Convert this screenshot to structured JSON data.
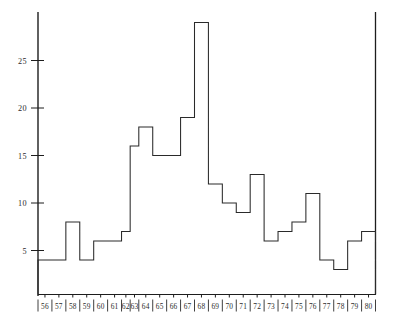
{
  "chart_data": {
    "type": "bar",
    "title": "",
    "subtitle": "",
    "xlabel": "",
    "ylabel": "",
    "categories": [
      "56",
      "57",
      "58",
      "59",
      "60",
      "61",
      "62",
      "63",
      "64",
      "65",
      "66",
      "67",
      "68",
      "69",
      "70",
      "71",
      "72",
      "73",
      "74",
      "75",
      "76",
      "77",
      "78",
      "79",
      "80"
    ],
    "values": [
      4,
      4,
      8,
      4,
      6,
      6,
      7,
      16,
      18,
      15,
      15,
      19,
      29,
      12,
      10,
      9,
      13,
      6,
      7,
      8,
      11,
      4,
      3,
      6,
      7
    ],
    "xtick_labels": [
      "56",
      "57",
      "58",
      "59",
      "60",
      "61",
      "62",
      "63",
      "64",
      "65",
      "66",
      "67",
      "68",
      "69",
      "70",
      "71",
      "72",
      "73",
      "74",
      "75",
      "76",
      "77",
      "78",
      "79",
      "80"
    ],
    "ytick_labels": [
      "5",
      "10",
      "15",
      "20",
      "25"
    ],
    "ytick_values": [
      5,
      10,
      15,
      20,
      25
    ],
    "ylim": [
      0,
      30
    ],
    "xlim": [
      0,
      25
    ],
    "grid": false,
    "legend": null,
    "narrow_bins": [
      "62",
      "63"
    ],
    "peak_category": "68",
    "peak_value": 29,
    "line_color": "#2a2a2a",
    "axis_color": "#1d1d1d",
    "background_color": "#ffffff"
  },
  "figure": {
    "caption": ""
  }
}
